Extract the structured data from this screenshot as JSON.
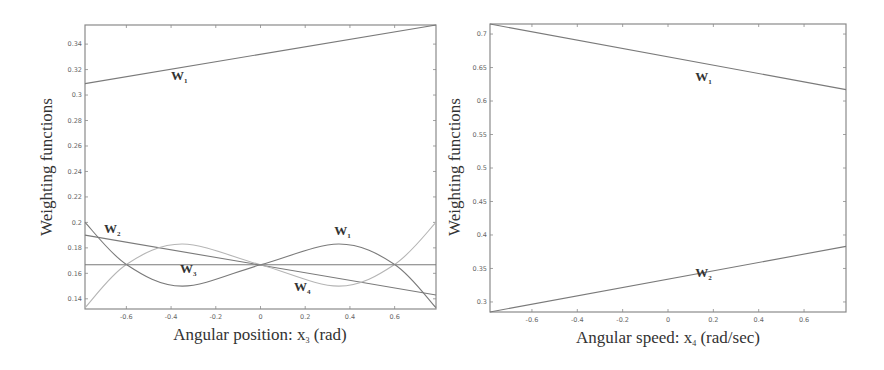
{
  "chart_data": [
    {
      "type": "line",
      "title": "",
      "xlabel": "Angular position: x3 (rad)",
      "ylabel": "Weighting functions",
      "xlim": [
        -0.785,
        0.785
      ],
      "ylim": [
        0.132,
        0.355
      ],
      "xticks": [
        "-0.6",
        "-0.4",
        "-0.2",
        "0",
        "0.2",
        "0.4",
        "0.6"
      ],
      "yticks": [
        "0.14",
        "0.16",
        "0.18",
        "0.2",
        "0.22",
        "0.24",
        "0.26",
        "0.28",
        "0.3",
        "0.32",
        "0.34"
      ],
      "grid": false,
      "series": [
        {
          "name": "W1",
          "x": [
            -0.785,
            0.785
          ],
          "values": [
            0.309,
            0.355
          ]
        },
        {
          "name": "W2",
          "x": [
            -0.785,
            0.785
          ],
          "values": [
            0.19,
            0.143
          ]
        },
        {
          "name": "W3",
          "x": [
            -0.785,
            -0.6,
            -0.35,
            0,
            0.35,
            0.6,
            0.785
          ],
          "values": [
            0.2,
            0.167,
            0.15,
            0.1667,
            0.183,
            0.167,
            0.133
          ]
        },
        {
          "name": "W4",
          "x": [
            -0.785,
            -0.6,
            -0.35,
            0,
            0.35,
            0.6,
            0.785
          ],
          "values": [
            0.133,
            0.167,
            0.183,
            0.1667,
            0.15,
            0.167,
            0.2
          ]
        },
        {
          "name": "constant",
          "x": [
            -0.785,
            0.785
          ],
          "values": [
            0.1667,
            0.1667
          ]
        }
      ],
      "labels": [
        {
          "text": "W",
          "sub": "1",
          "x": -0.4,
          "y": 0.312
        },
        {
          "text": "W",
          "sub": "2",
          "x": -0.7,
          "y": 0.192
        },
        {
          "text": "W",
          "sub": "3",
          "x": -0.36,
          "y": 0.16
        },
        {
          "text": "W",
          "sub": "1",
          "x": 0.33,
          "y": 0.19
        },
        {
          "text": "W",
          "sub": "4",
          "x": 0.15,
          "y": 0.146
        }
      ]
    },
    {
      "type": "line",
      "title": "",
      "xlabel": "Angular speed: x4 (rad/sec)",
      "ylabel": "Weighting functions",
      "xlim": [
        -0.785,
        0.785
      ],
      "ylim": [
        0.285,
        0.715
      ],
      "xticks": [
        "-0.6",
        "-0.4",
        "-0.2",
        "0",
        "0.2",
        "0.4",
        "0.6"
      ],
      "yticks": [
        "0.3",
        "0.35",
        "0.4",
        "0.45",
        "0.5",
        "0.55",
        "0.6",
        "0.65",
        "0.7"
      ],
      "grid": false,
      "series": [
        {
          "name": "W1",
          "x": [
            -0.785,
            0.785
          ],
          "values": [
            0.715,
            0.617
          ]
        },
        {
          "name": "W2",
          "x": [
            -0.785,
            0.785
          ],
          "values": [
            0.285,
            0.383
          ]
        }
      ],
      "labels": [
        {
          "text": "W",
          "sub": "1",
          "x": 0.12,
          "y": 0.63
        },
        {
          "text": "W",
          "sub": "2",
          "x": 0.12,
          "y": 0.338
        }
      ]
    }
  ],
  "left": {
    "ylabel": "Weighting functions",
    "xlabel_main": "Angular position: x",
    "xlabel_sub": "3",
    "xlabel_tail": " (rad)"
  },
  "right": {
    "ylabel": "Weighting functions",
    "xlabel_main": "Angular speed: x",
    "xlabel_sub": "4",
    "xlabel_tail": " (rad/sec)"
  },
  "colors": {
    "frame": "#8a8a8a",
    "line_dark": "#7a7a7a",
    "line_light": "#b5b5b5"
  }
}
